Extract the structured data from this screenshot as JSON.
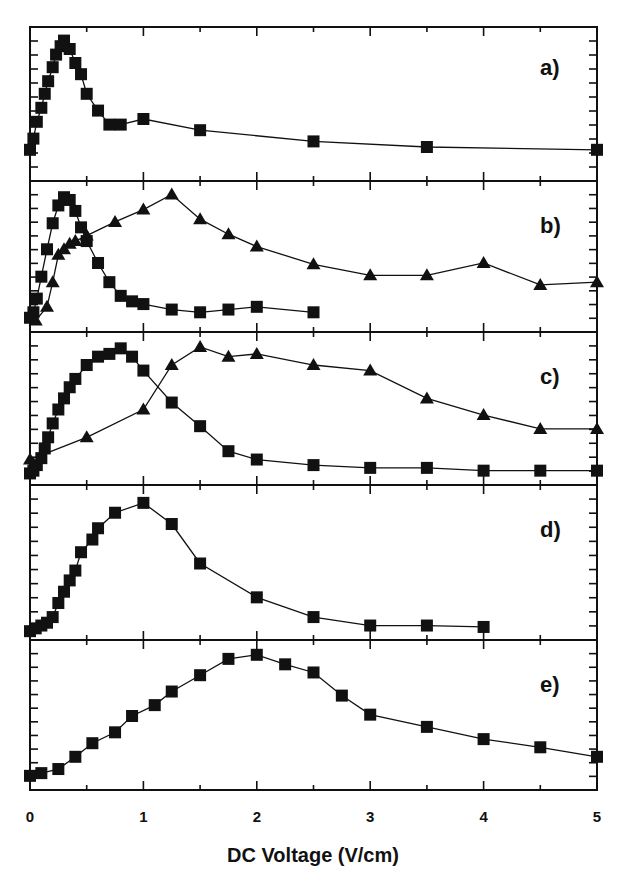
{
  "chart_data": {
    "type": "line",
    "layout": "5 vertically stacked panels sharing x-axis, no y tick labels, no gridlines, no legend",
    "xlabel": "DC Voltage (V/cm)",
    "xlim": [
      0,
      5
    ],
    "x_ticks": [
      "0",
      "1",
      "2",
      "3",
      "4",
      "5"
    ],
    "ylabel": "",
    "marker_color": "#111111",
    "panels": [
      {
        "label": "a)",
        "series": [
          {
            "name": "squares",
            "marker": "square",
            "x": [
              0.0,
              0.03,
              0.06,
              0.1,
              0.13,
              0.16,
              0.2,
              0.23,
              0.27,
              0.3,
              0.35,
              0.4,
              0.45,
              0.5,
              0.6,
              0.7,
              0.8,
              1.0,
              1.5,
              2.5,
              3.5,
              5.0
            ],
            "y": [
              0.18,
              0.26,
              0.38,
              0.48,
              0.58,
              0.67,
              0.77,
              0.86,
              0.92,
              0.96,
              0.9,
              0.8,
              0.72,
              0.58,
              0.46,
              0.36,
              0.36,
              0.4,
              0.32,
              0.24,
              0.2,
              0.18
            ]
          }
        ]
      },
      {
        "label": "b)",
        "series": [
          {
            "name": "squares",
            "marker": "square",
            "x": [
              0.0,
              0.03,
              0.06,
              0.1,
              0.15,
              0.2,
              0.25,
              0.3,
              0.35,
              0.4,
              0.45,
              0.5,
              0.6,
              0.7,
              0.8,
              0.9,
              1.0,
              1.25,
              1.5,
              1.75,
              2.0,
              2.5
            ],
            "y": [
              0.06,
              0.1,
              0.2,
              0.36,
              0.56,
              0.75,
              0.88,
              0.94,
              0.92,
              0.84,
              0.72,
              0.62,
              0.46,
              0.32,
              0.22,
              0.18,
              0.16,
              0.12,
              0.1,
              0.12,
              0.14,
              0.1
            ]
          },
          {
            "name": "triangles",
            "marker": "triangle",
            "x": [
              0.05,
              0.15,
              0.2,
              0.25,
              0.3,
              0.35,
              0.4,
              0.5,
              0.75,
              1.0,
              1.25,
              1.5,
              1.75,
              2.0,
              2.5,
              3.0,
              3.5,
              4.0,
              4.5,
              5.0
            ],
            "y": [
              0.04,
              0.14,
              0.32,
              0.52,
              0.56,
              0.6,
              0.62,
              0.66,
              0.76,
              0.85,
              0.96,
              0.78,
              0.67,
              0.58,
              0.45,
              0.37,
              0.37,
              0.46,
              0.3,
              0.32
            ]
          }
        ]
      },
      {
        "label": "c)",
        "series": [
          {
            "name": "squares",
            "marker": "square",
            "x": [
              0.0,
              0.03,
              0.06,
              0.1,
              0.13,
              0.16,
              0.2,
              0.25,
              0.3,
              0.35,
              0.4,
              0.5,
              0.6,
              0.7,
              0.8,
              0.9,
              1.0,
              1.25,
              1.5,
              1.75,
              2.0,
              2.5,
              3.0,
              3.5,
              4.0,
              4.5,
              5.0
            ],
            "y": [
              0.04,
              0.06,
              0.1,
              0.15,
              0.22,
              0.3,
              0.4,
              0.5,
              0.58,
              0.66,
              0.72,
              0.82,
              0.88,
              0.9,
              0.94,
              0.88,
              0.78,
              0.55,
              0.38,
              0.2,
              0.14,
              0.1,
              0.08,
              0.08,
              0.06,
              0.06,
              0.06
            ]
          },
          {
            "name": "triangles",
            "marker": "triangle",
            "x": [
              0.0,
              0.5,
              1.0,
              1.25,
              1.5,
              1.75,
              2.0,
              2.5,
              3.0,
              3.5,
              4.0,
              4.5,
              5.0
            ],
            "y": [
              0.14,
              0.3,
              0.5,
              0.82,
              0.95,
              0.88,
              0.9,
              0.82,
              0.78,
              0.58,
              0.46,
              0.36,
              0.36
            ]
          }
        ]
      },
      {
        "label": "d)",
        "series": [
          {
            "name": "squares",
            "marker": "square",
            "x": [
              0.0,
              0.05,
              0.1,
              0.15,
              0.2,
              0.25,
              0.3,
              0.35,
              0.4,
              0.45,
              0.55,
              0.6,
              0.75,
              1.0,
              1.25,
              1.5,
              2.0,
              2.5,
              3.0,
              3.5,
              4.0
            ],
            "y": [
              0.02,
              0.04,
              0.06,
              0.08,
              0.12,
              0.22,
              0.3,
              0.38,
              0.45,
              0.58,
              0.67,
              0.75,
              0.86,
              0.93,
              0.78,
              0.5,
              0.26,
              0.12,
              0.06,
              0.06,
              0.05
            ]
          }
        ]
      },
      {
        "label": "e)",
        "series": [
          {
            "name": "squares",
            "marker": "square",
            "x": [
              0.0,
              0.1,
              0.25,
              0.4,
              0.55,
              0.75,
              0.9,
              1.1,
              1.25,
              1.5,
              1.75,
              2.0,
              2.25,
              2.5,
              2.75,
              3.0,
              3.5,
              4.0,
              4.5,
              5.0
            ],
            "y": [
              0.06,
              0.08,
              0.11,
              0.2,
              0.3,
              0.38,
              0.5,
              0.58,
              0.68,
              0.8,
              0.92,
              0.95,
              0.88,
              0.82,
              0.65,
              0.51,
              0.42,
              0.33,
              0.27,
              0.2,
              0.15
            ]
          }
        ]
      }
    ]
  }
}
